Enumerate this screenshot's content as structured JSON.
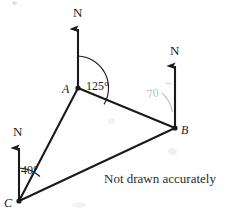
{
  "figure": {
    "note": "Not drawn accurately",
    "stroke_color": "#1a1a1a",
    "pencil_color": "#b9bcc0"
  },
  "vertices": [
    {
      "id": "A",
      "label": "A",
      "x": 78,
      "y": 88,
      "label_x": 62,
      "label_y": 83
    },
    {
      "id": "B",
      "label": "B",
      "x": 175,
      "y": 128,
      "label_x": 181,
      "label_y": 124
    },
    {
      "id": "C",
      "label": "C",
      "x": 19,
      "y": 201,
      "label_x": 4,
      "label_y": 197
    }
  ],
  "north_arrows": [
    {
      "at": "A",
      "label": "N",
      "from_x": 78,
      "from_y": 88,
      "to_x": 78,
      "to_y": 26,
      "label_x": 73,
      "label_y": 6
    },
    {
      "at": "B",
      "label": "N",
      "from_x": 175,
      "from_y": 128,
      "to_x": 175,
      "to_y": 63,
      "label_x": 170,
      "label_y": 44
    },
    {
      "at": "C",
      "label": "N",
      "from_x": 19,
      "from_y": 201,
      "to_x": 19,
      "to_y": 145,
      "label_x": 13,
      "label_y": 125
    }
  ],
  "sides": [
    {
      "from": "A",
      "to": "B",
      "x1": 78,
      "y1": 88,
      "x2": 175,
      "y2": 128
    },
    {
      "from": "A",
      "to": "C",
      "x1": 78,
      "y1": 88,
      "x2": 19,
      "y2": 201
    },
    {
      "from": "C",
      "to": "B",
      "x1": 19,
      "y1": 201,
      "x2": 175,
      "y2": 128
    }
  ],
  "angles": [
    {
      "id": "bearing-at-A",
      "value": "125°",
      "vertex": "A",
      "radius": 32,
      "label_x": 86,
      "label_y": 80,
      "style": "ink"
    },
    {
      "id": "bearing-at-C",
      "value": "40°",
      "vertex": "C",
      "radius": 33,
      "label_x": 21,
      "label_y": 164,
      "style": "ink"
    },
    {
      "id": "bearing-at-B-pencil",
      "value": "70",
      "vertex": "B",
      "radius": 38,
      "label_x": 146,
      "label_y": 88,
      "style": "pencil"
    }
  ],
  "note_position": {
    "x": 104,
    "y": 172
  }
}
